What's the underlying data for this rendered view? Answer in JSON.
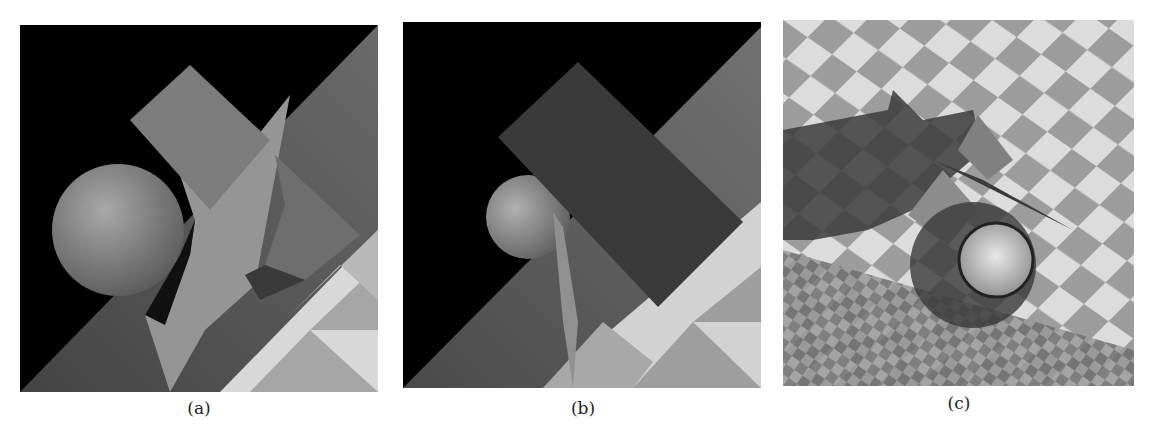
{
  "figure": {
    "panels": [
      {
        "id": "a",
        "caption": "(a)",
        "description": "Ray-traced scene: sphere, two cubes, and a bent plane over a wood-textured and checkered floor on black background"
      },
      {
        "id": "b",
        "caption": "(b)",
        "description": "Same scene from a different viewpoint: large dark cube occluding sphere, wood and checker floor"
      },
      {
        "id": "c",
        "caption": "(c)",
        "description": "Top-down view: sphere with shadow, cubes and plane over checkerboard floor"
      }
    ],
    "colors": {
      "background": "#000000",
      "object_gray": "#7a7a7a",
      "plane_light": "#9a9a9a",
      "checker_light": "#e6e6e6",
      "checker_dark": "#a0a0a0"
    }
  }
}
